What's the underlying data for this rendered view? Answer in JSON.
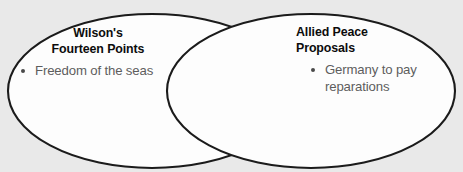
{
  "diagram": {
    "type": "venn",
    "title": "",
    "background_color": "#e9e9e9",
    "shape_fill_color": "#fdfdfd",
    "shape_stroke_color": "#1b1b1b",
    "heading_color": "#0c0c0c",
    "body_text_color": "#5d5d5d",
    "sets": [
      {
        "id": "left",
        "heading_line_1": "Wilson's",
        "heading_line_2": "Fourteen Points",
        "items": [
          {
            "bullet": "•",
            "text": "Freedom of the seas"
          }
        ]
      },
      {
        "id": "right",
        "heading_line_1": "Allied Peace",
        "heading_line_2": "Proposals",
        "items": [
          {
            "bullet": "•",
            "text": "Germany to pay reparations"
          }
        ]
      }
    ],
    "overlap": {
      "items": []
    }
  }
}
